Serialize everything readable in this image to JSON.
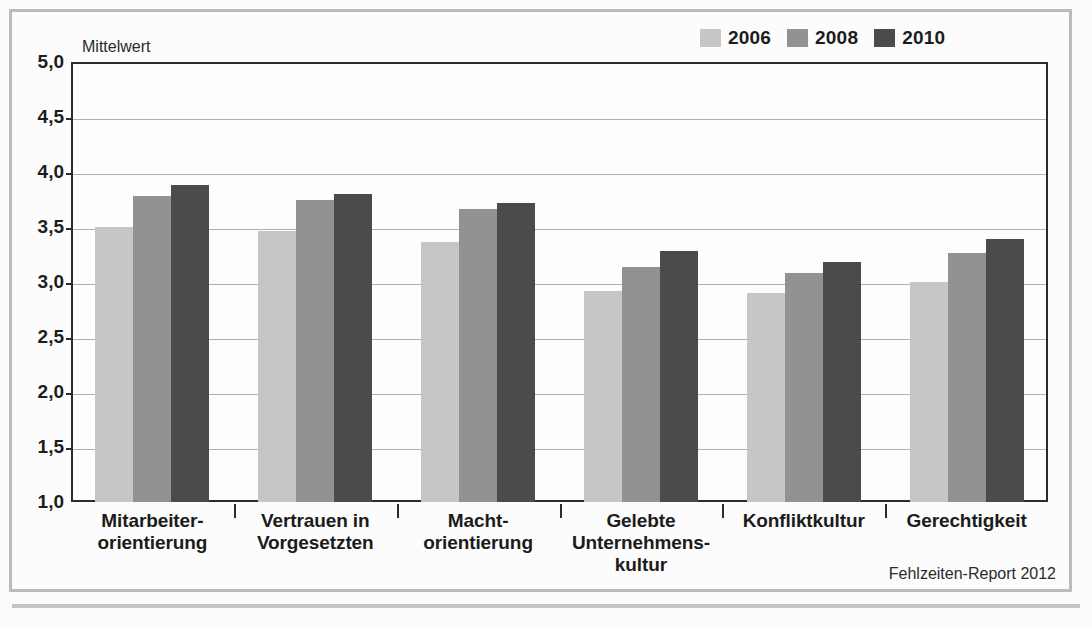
{
  "figure": {
    "axis_title": "Mittelwert",
    "source_note": "Fehlzeiten-Report 2012"
  },
  "colors": {
    "series_2006": "#c6c6c6",
    "series_2008": "#929292",
    "series_2010": "#4b4b4b",
    "axis": "#2b2b2b",
    "grid": "#b0b0b0",
    "frame": "#b9bcbe",
    "background": "#fcfcfc"
  },
  "legend": {
    "position": "top-right",
    "entries": [
      {
        "label": "2006",
        "color": "#c6c6c6"
      },
      {
        "label": "2008",
        "color": "#929292"
      },
      {
        "label": "2010",
        "color": "#4b4b4b"
      }
    ]
  },
  "yaxis": {
    "ticks": [
      "5,0",
      "4,5",
      "4,0",
      "3,5",
      "3,0",
      "2,5",
      "2,0",
      "1,5",
      "1,0"
    ],
    "tick_values": [
      5.0,
      4.5,
      4.0,
      3.5,
      3.0,
      2.5,
      2.0,
      1.5,
      1.0
    ],
    "min": 1.0,
    "max": 5.0
  },
  "categories": [
    {
      "lines": [
        "Mitarbeiter-",
        "orientierung"
      ]
    },
    {
      "lines": [
        "Vertrauen in",
        "Vorgesetzten"
      ]
    },
    {
      "lines": [
        "Macht-",
        "orientierung"
      ]
    },
    {
      "lines": [
        "Gelebte",
        "Unternehmens-",
        "kultur"
      ]
    },
    {
      "lines": [
        "Konfliktkultur"
      ]
    },
    {
      "lines": [
        "Gerechtigkeit"
      ]
    }
  ],
  "chart_data": {
    "type": "bar",
    "title": "",
    "subtitle": "",
    "xlabel": "",
    "ylabel": "Mittelwert",
    "ylim": [
      1.0,
      5.0
    ],
    "ytick_values": [
      1.0,
      1.5,
      2.0,
      2.5,
      3.0,
      3.5,
      4.0,
      4.5,
      5.0
    ],
    "ytick_labels": [
      "1,0",
      "1,5",
      "2,0",
      "2,5",
      "3,0",
      "3,5",
      "4,0",
      "4,5",
      "5,0"
    ],
    "grid": true,
    "legend_position": "top-right",
    "categories": [
      "Mitarbeiterorientierung",
      "Vertrauen in Vorgesetzten",
      "Machtorientierung",
      "Gelebte Unternehmenskultur",
      "Konfliktkultur",
      "Gerechtigkeit"
    ],
    "series": [
      {
        "name": "2006",
        "color": "#c6c6c6",
        "values": [
          3.5,
          3.46,
          3.36,
          2.92,
          2.9,
          3.0
        ]
      },
      {
        "name": "2008",
        "color": "#929292",
        "values": [
          3.78,
          3.75,
          3.66,
          3.14,
          3.08,
          3.26
        ]
      },
      {
        "name": "2010",
        "color": "#4b4b4b",
        "values": [
          3.88,
          3.8,
          3.72,
          3.28,
          3.18,
          3.39
        ]
      }
    ],
    "annotations": [
      "Fehlzeiten-Report 2012"
    ]
  }
}
